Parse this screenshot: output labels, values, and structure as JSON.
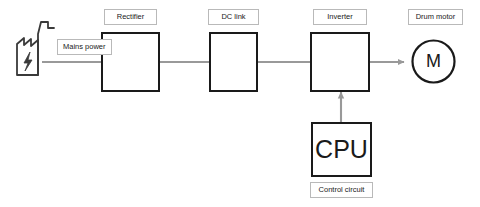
{
  "diagram": {
    "colors": {
      "block_stroke": "#1a1a1a",
      "connector": "#999999",
      "label_border": "#b9b9b9",
      "background": "#ffffff"
    },
    "labels": {
      "mains_power": "Mains power",
      "rectifier": "Rectifier",
      "dc_link": "DC link",
      "inverter": "Inverter",
      "drum_motor": "Drum motor",
      "control_circuit": "Control circuit"
    },
    "blocks": {
      "source": {
        "name": "power-plant",
        "icon": "factory-lightning-icon"
      },
      "rectifier": {
        "input_symbol": "ac-sine-symbol",
        "output_symbol": "dc-line-symbol"
      },
      "dc_link": {
        "symbol": "capacitor-symbol"
      },
      "inverter": {
        "input_symbol": "dc-line-symbol",
        "output_symbol": "ac-sine-symbol"
      },
      "cpu": {
        "text": "CPU"
      },
      "motor": {
        "text": "M",
        "shape": "circle"
      }
    },
    "connections": [
      {
        "from": "power-plant",
        "to": "rectifier",
        "style": "line"
      },
      {
        "from": "rectifier",
        "to": "dc-link",
        "style": "line"
      },
      {
        "from": "dc-link",
        "to": "inverter",
        "style": "line"
      },
      {
        "from": "inverter",
        "to": "drum-motor",
        "style": "arrow"
      },
      {
        "from": "cpu",
        "to": "inverter",
        "style": "arrow-up"
      }
    ]
  }
}
